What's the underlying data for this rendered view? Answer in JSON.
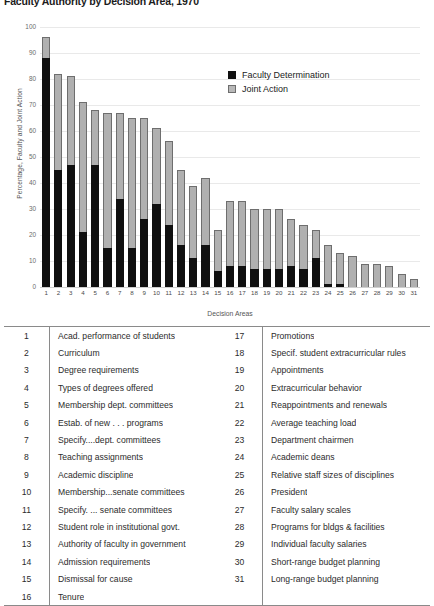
{
  "chart_title": "Faculty Authority by Decision Area, 1970",
  "axes": {
    "ylabel": "Percentage, Faculty and Joint Action",
    "xlabel": "Decision Areas",
    "yticks": [
      0,
      10,
      20,
      30,
      40,
      50,
      60,
      70,
      80,
      90,
      100
    ]
  },
  "legend": {
    "items": [
      {
        "label": "Faculty Determination",
        "color": "#101010"
      },
      {
        "label": "Joint Action",
        "color": "#b8b8b8"
      }
    ]
  },
  "chart_data": {
    "type": "bar",
    "title": "Faculty Authority by Decision Area, 1970",
    "xlabel": "Decision Areas",
    "ylabel": "Percentage, Faculty and Joint Action",
    "ylim": [
      0,
      100
    ],
    "grid": true,
    "stacked": true,
    "legend_position": "upper right",
    "categories": [
      "1",
      "2",
      "3",
      "4",
      "5",
      "6",
      "7",
      "8",
      "9",
      "10",
      "11",
      "12",
      "13",
      "14",
      "15",
      "16",
      "17",
      "18",
      "19",
      "20",
      "21",
      "22",
      "23",
      "24",
      "25",
      "26",
      "27",
      "28",
      "29",
      "30",
      "31"
    ],
    "series": [
      {
        "name": "Faculty Determination",
        "color": "#101010",
        "values": [
          88,
          45,
          47,
          21,
          47,
          15,
          34,
          15,
          26,
          32,
          24,
          16,
          11,
          16,
          6,
          8,
          8,
          7,
          7,
          7,
          8,
          7,
          11,
          1,
          1,
          0,
          0,
          0,
          0,
          0,
          0
        ]
      },
      {
        "name": "Joint Action",
        "color": "#b8b8b8",
        "values": [
          8,
          37,
          34,
          50,
          21,
          52,
          33,
          50,
          39,
          29,
          32,
          29,
          28,
          26,
          16,
          25,
          25,
          23,
          23,
          23,
          18,
          17,
          11,
          15,
          12,
          12,
          9,
          9,
          8,
          5,
          3
        ]
      }
    ],
    "totals": [
      96,
      82,
      81,
      71,
      68,
      67,
      67,
      65,
      65,
      61,
      56,
      45,
      39,
      42,
      22,
      33,
      33,
      30,
      30,
      30,
      26,
      24,
      22,
      16,
      13,
      12,
      9,
      9,
      8,
      5,
      3
    ]
  },
  "decision_areas": {
    "left": [
      {
        "num": "1",
        "label": "Acad. performance of students"
      },
      {
        "num": "2",
        "label": "Curriculum"
      },
      {
        "num": "3",
        "label": "Degree requirements"
      },
      {
        "num": "4",
        "label": "Types of degrees offered"
      },
      {
        "num": "5",
        "label": "Membership dept. committees"
      },
      {
        "num": "6",
        "label": "Estab. of new . . . programs"
      },
      {
        "num": "7",
        "label": "Specify....dept. committees"
      },
      {
        "num": "8",
        "label": "Teaching assignments"
      },
      {
        "num": "9",
        "label": "Academic discipline"
      },
      {
        "num": "10",
        "label": "Membership...senate committees"
      },
      {
        "num": "11",
        "label": "Specify. ... senate committees"
      },
      {
        "num": "12",
        "label": "Student role in institutional govt."
      },
      {
        "num": "13",
        "label": "Authority of faculty in government"
      },
      {
        "num": "14",
        "label": "Admission requirements"
      },
      {
        "num": "15",
        "label": "Dismissal for cause"
      },
      {
        "num": "16",
        "label": "Tenure"
      }
    ],
    "right": [
      {
        "num": "17",
        "label": "Promotions"
      },
      {
        "num": "18",
        "label": "Specif. student extracurricular rules"
      },
      {
        "num": "19",
        "label": "Appointments"
      },
      {
        "num": "20",
        "label": "Extracurricular behavior"
      },
      {
        "num": "21",
        "label": "Reappointments and renewals"
      },
      {
        "num": "22",
        "label": "Average teaching load"
      },
      {
        "num": "23",
        "label": "Department chairmen"
      },
      {
        "num": "24",
        "label": "Academic deans"
      },
      {
        "num": "25",
        "label": "Relative staff sizes of disciplines"
      },
      {
        "num": "26",
        "label": "President"
      },
      {
        "num": "27",
        "label": "Faculty salary scales"
      },
      {
        "num": "28",
        "label": "Programs for bldgs & facilities"
      },
      {
        "num": "29",
        "label": "Individual faculty salaries"
      },
      {
        "num": "30",
        "label": "Short-range budget planning"
      },
      {
        "num": "31",
        "label": "Long-range budget planning"
      },
      {
        "num": "",
        "label": ""
      }
    ]
  }
}
